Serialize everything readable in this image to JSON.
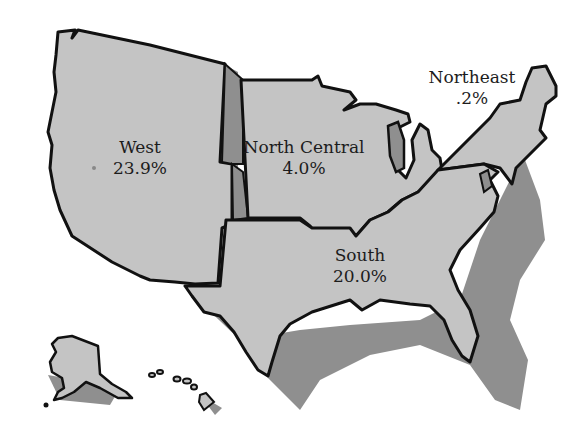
{
  "map": {
    "colors": {
      "land": "#c4c4c4",
      "shadow": "#8f8f8f",
      "outline": "#111111",
      "background": "#ffffff",
      "text": "#1c1c1c"
    },
    "regions": [
      {
        "id": "west",
        "name": "West",
        "value": "23.9%"
      },
      {
        "id": "north-central",
        "name": "North Central",
        "value": "4.0%"
      },
      {
        "id": "northeast",
        "name": "Northeast",
        "value": ".2%"
      },
      {
        "id": "south",
        "name": "South",
        "value": "20.0%"
      }
    ],
    "insets": [
      "Alaska",
      "Hawaii"
    ]
  }
}
